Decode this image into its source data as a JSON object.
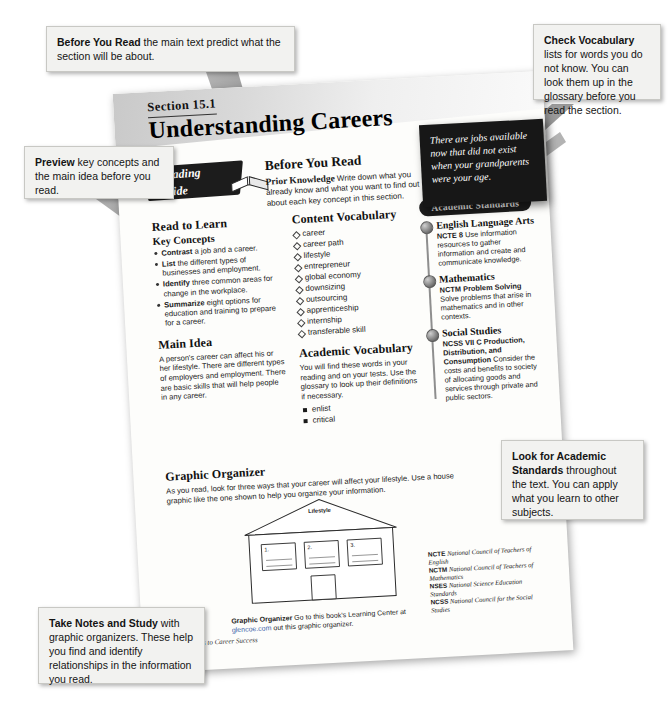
{
  "document": {
    "section_number": "Section 15.1",
    "title": "Understanding Careers",
    "reading_guide_badge_line1": "Reading",
    "reading_guide_badge_line2": "Guide",
    "page_footer_number": "5",
    "page_footer_title": "Pathways to Career Success"
  },
  "before_you_read": {
    "heading": "Before You Read",
    "lead": "Prior Knowledge",
    "body": "Write down what you already know and what you want to find out about each key concept in this section."
  },
  "read_to_learn": {
    "heading": "Read to Learn",
    "subheading": "Key Concepts",
    "items": [
      {
        "lead": "Contrast",
        "rest": " a job and a career."
      },
      {
        "lead": "List",
        "rest": " the different types of businesses and employment."
      },
      {
        "lead": "Identify",
        "rest": " three common areas for change in the workplace."
      },
      {
        "lead": "Summarize",
        "rest": " eight options for education and training to prepare for a career."
      }
    ]
  },
  "main_idea": {
    "heading": "Main Idea",
    "body": "A person's career can affect his or her lifestyle. There are different types of employers and employment. There are basic skills that will help people in any career."
  },
  "content_vocabulary": {
    "heading": "Content Vocabulary",
    "terms": [
      "career",
      "career path",
      "lifestyle",
      "entrepreneur",
      "global economy",
      "downsizing",
      "outsourcing",
      "apprenticeship",
      "internship",
      "transferable skill"
    ]
  },
  "academic_vocabulary": {
    "heading": "Academic Vocabulary",
    "body": "You will find these words in your reading and on your tests. Use the glossary to look up their definitions if necessary.",
    "terms": [
      "enlist",
      "critical"
    ]
  },
  "academic_standards": {
    "pill_label": "Academic Standards",
    "items": [
      {
        "subject": "English Language Arts",
        "code": "NCTE 8",
        "text": "Use information resources to gather information and create and communicate knowledge."
      },
      {
        "subject": "Mathematics",
        "code": "NCTM Problem Solving",
        "text": "Solve problems that arise in mathematics and in other contexts."
      },
      {
        "subject": "Social Studies",
        "code": "NCSS VII C Production, Distribution, and Consumption",
        "text": "Consider the costs and benefits to society of allocating goods and services through private and public sectors."
      }
    ],
    "abbreviations": [
      {
        "abbr": "NCTE",
        "full": "National Council of Teachers of English"
      },
      {
        "abbr": "NCTM",
        "full": "National Council of Teachers of Mathematics"
      },
      {
        "abbr": "NSES",
        "full": "National Science Education Standards"
      },
      {
        "abbr": "NCSS",
        "full": "National Council for the Social Studies"
      }
    ]
  },
  "graphic_organizer": {
    "heading": "Graphic Organizer",
    "body": "As you read, look for three ways that your career will affect your lifestyle. Use a house graphic like the one shown to help you organize your information.",
    "house_label": "Lifestyle",
    "boxes": [
      "1.",
      "2.",
      "3."
    ],
    "footer_lead": "Graphic Organizer",
    "footer_text_1": "Go to this book's",
    "footer_text_2": "Learning Center at",
    "footer_link": "glencoe.com",
    "footer_text_3": "out this graphic organizer."
  },
  "quote_note": {
    "text": "There are jobs available now that did not exist when your grandparents were your age."
  },
  "callouts": [
    {
      "id": "callout-before",
      "lead": "Before You Read",
      "rest": " the main text predict what the section will be about."
    },
    {
      "id": "callout-preview",
      "lead": "Preview",
      "rest": " key concepts and the main idea before you read."
    },
    {
      "id": "callout-vocab",
      "lead": "Check Vocabulary",
      "rest": " lists for words you do not know. You can look them up in the glossary before you read the section."
    },
    {
      "id": "callout-standards",
      "lead": "Look for Academic Standards",
      "rest": " throughout the text. You can apply what you learn to other subjects."
    },
    {
      "id": "callout-notes",
      "lead": "Take Notes and Study",
      "rest": " with graphic organizers. These help you find and identify relationships in the information you read."
    }
  ],
  "colors": {
    "note_background": "#171717",
    "callout_background": "#f2f2f0",
    "page_background": "#fdfdfb",
    "arrow_gray": "#8a8a8a",
    "link_blue": "#3b5fa8"
  }
}
